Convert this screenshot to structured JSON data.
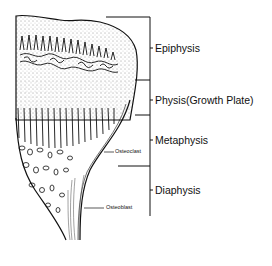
{
  "diagram": {
    "regions": [
      {
        "id": "epiphysis",
        "label": "Epiphysis",
        "y_top": 17,
        "y_bottom": 80,
        "label_y": 48
      },
      {
        "id": "physis",
        "label": "Physis(Growth Plate)",
        "y_top": 80,
        "y_bottom": 115,
        "label_y": 100
      },
      {
        "id": "metaphysis",
        "label": "Metaphysis",
        "y_top": 115,
        "y_bottom": 166,
        "label_y": 140
      },
      {
        "id": "diaphysis",
        "label": "Diaphysis",
        "y_top": 166,
        "y_bottom": 216,
        "label_y": 190
      }
    ],
    "callouts": [
      {
        "id": "osteoclast",
        "label": "Osteoclast",
        "y": 152
      },
      {
        "id": "osteoblast",
        "label": "Osteoblast",
        "y": 208
      }
    ],
    "colors": {
      "ink": "#111111",
      "background": "#ffffff"
    }
  }
}
